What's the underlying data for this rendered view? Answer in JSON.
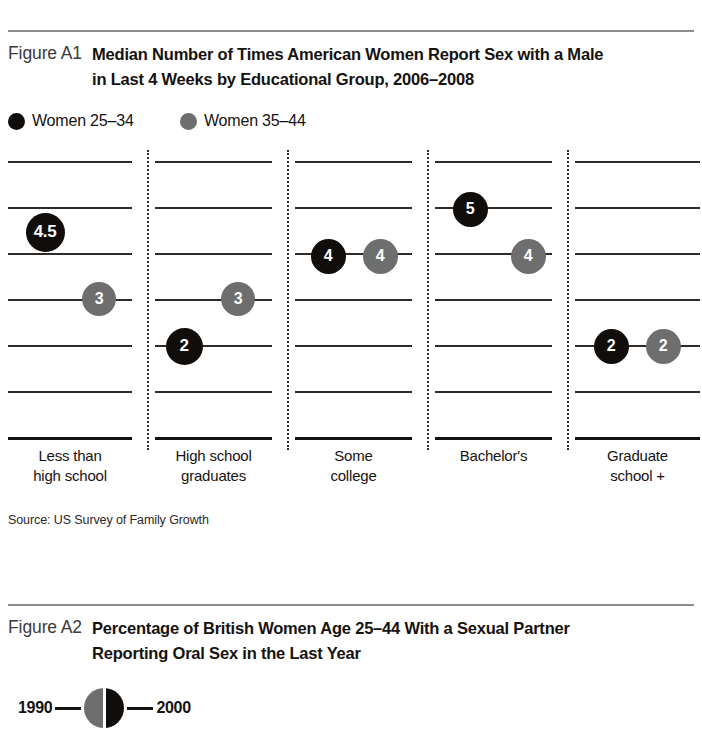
{
  "figure_a1": {
    "label": "Figure A1",
    "title_line1": "Median Number of Times American Women Report Sex with a Male",
    "title_line2": "in Last 4 Weeks by Educational Group, 2006–2008",
    "legend": [
      {
        "label": "Women 25–34",
        "color": "#100d0b",
        "icon": "filled-circle-icon"
      },
      {
        "label": "Women 35–44",
        "color": "#6e6e6e",
        "icon": "filled-circle-icon"
      }
    ],
    "source": "Source: US Survey of Family Growth"
  },
  "figure_a2": {
    "label": "Figure A2",
    "title_line1": "Percentage of British Women Age 25–44 With a Sexual Partner",
    "title_line2": "Reporting Oral Sex in the Last Year",
    "legend": {
      "left_year": "1990",
      "right_year": "2000",
      "left_color": "#6e6e6e",
      "right_color": "#100d0b",
      "icon": "split-circle-icon"
    }
  },
  "chart_data": {
    "type": "scatter",
    "title": "Median Number of Times American Women Report Sex with a Male in Last 4 Weeks by Educational Group, 2006–2008",
    "xlabel": "",
    "ylabel": "",
    "ylim": [
      0,
      6
    ],
    "grid": true,
    "gridlines": [
      6,
      5,
      4,
      3,
      2,
      1,
      0
    ],
    "legend_position": "top-left",
    "categories": [
      "Less than\nhigh school",
      "High school\ngraduates",
      "Some\ncollege",
      "Bachelor's",
      "Graduate\nschool +"
    ],
    "category_labels": [
      {
        "line1": "Less than",
        "line2": "high school"
      },
      {
        "line1": "High school",
        "line2": "graduates"
      },
      {
        "line1": "Some",
        "line2": "college"
      },
      {
        "line1": "Bachelor's",
        "line2": ""
      },
      {
        "line1": "Graduate",
        "line2": "school +"
      }
    ],
    "series": [
      {
        "name": "Women 25–34",
        "color": "#100d0b",
        "values": [
          4.5,
          2,
          4,
          5,
          2
        ],
        "labels": [
          "4.5",
          "2",
          "4",
          "5",
          "2"
        ]
      },
      {
        "name": "Women 35–44",
        "color": "#6e6e6e",
        "values": [
          3,
          3,
          4,
          4,
          2
        ],
        "labels": [
          "3",
          "3",
          "4",
          "4",
          "2"
        ]
      }
    ]
  },
  "markers": [
    {
      "label": "4.5",
      "style": "dark",
      "x": 45,
      "y": 232,
      "size": 39,
      "font": 17,
      "name": "marker-less-than-high-school-25-34"
    },
    {
      "label": "3",
      "style": "gray",
      "x": 99,
      "y": 299,
      "size": 34,
      "font": 16,
      "name": "marker-less-than-high-school-35-44"
    },
    {
      "label": "2",
      "style": "dark",
      "x": 184,
      "y": 346,
      "size": 37,
      "font": 17,
      "name": "marker-high-school-graduates-25-34"
    },
    {
      "label": "3",
      "style": "gray",
      "x": 238,
      "y": 299,
      "size": 34,
      "font": 16,
      "name": "marker-high-school-graduates-35-44"
    },
    {
      "label": "4",
      "style": "dark",
      "x": 328,
      "y": 256,
      "size": 35,
      "font": 16,
      "name": "marker-some-college-25-34"
    },
    {
      "label": "4",
      "style": "gray",
      "x": 380,
      "y": 256,
      "size": 35,
      "font": 16,
      "name": "marker-some-college-35-44"
    },
    {
      "label": "5",
      "style": "dark",
      "x": 470,
      "y": 209,
      "size": 35,
      "font": 16,
      "name": "marker-bachelors-25-34"
    },
    {
      "label": "4",
      "style": "gray",
      "x": 528,
      "y": 256,
      "size": 35,
      "font": 16,
      "name": "marker-bachelors-35-44"
    },
    {
      "label": "2",
      "style": "dark",
      "x": 611,
      "y": 346,
      "size": 35,
      "font": 16,
      "name": "marker-graduate-school-25-34"
    },
    {
      "label": "2",
      "style": "gray",
      "x": 663,
      "y": 346,
      "size": 35,
      "font": 16,
      "name": "marker-graduate-school-35-44"
    }
  ],
  "layout": {
    "gridline_y": [
      11,
      57,
      103,
      149,
      195,
      241,
      287
    ],
    "column_spans": [
      [
        8,
        132
      ],
      [
        155,
        272
      ],
      [
        295,
        412
      ],
      [
        435,
        552
      ],
      [
        575,
        700
      ]
    ],
    "divider_x": [
      147,
      287,
      427,
      567
    ],
    "divider_top": 0,
    "divider_height": 300,
    "axis_y": 287,
    "xlabel_tops": 446
  }
}
